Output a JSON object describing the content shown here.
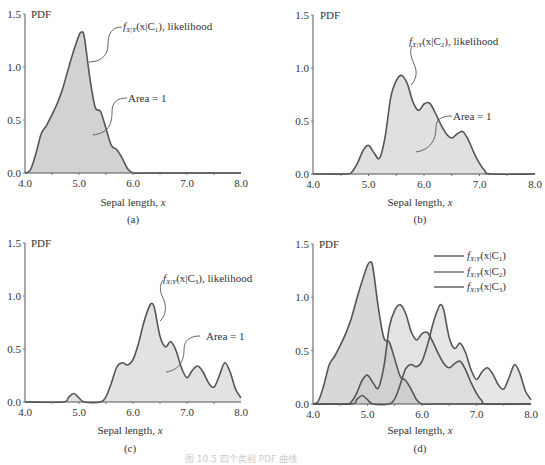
{
  "figure_caption": "图 10.5  四个类别 PDF 曲线",
  "colors": {
    "c1_fill": "#cfcfcf",
    "c2_fill": "#dedede",
    "c3_fill": "#e6e6e6",
    "c1_overlap_fill": "#bcbcbc",
    "c3_overlap_fill": "#a9a9a9",
    "line": "#555555"
  },
  "chart_data": [
    {
      "id": "a",
      "type": "area",
      "panel_label": "(a)",
      "xlabel": "Sepal length, x",
      "ylabel": "PDF",
      "xlim": [
        4.0,
        8.0
      ],
      "ylim": [
        0.0,
        1.5
      ],
      "xticks": [
        "4.0",
        "5.0",
        "6.0",
        "7.0",
        "8.0"
      ],
      "yticks": [
        "0.0",
        "0.5",
        "1.0",
        "1.5"
      ],
      "annotations": [
        "f_X|Y(x|C1), likelihood",
        "Area = 1"
      ],
      "series": [
        {
          "name": "f_X|Y(x|C1)",
          "x": [
            4.0,
            4.1,
            4.2,
            4.3,
            4.4,
            4.5,
            4.6,
            4.7,
            4.8,
            4.9,
            5.0,
            5.05,
            5.1,
            5.2,
            5.3,
            5.4,
            5.5,
            5.6,
            5.7,
            5.8,
            5.9,
            6.0,
            6.2,
            7.0,
            8.0
          ],
          "y": [
            0.0,
            0.03,
            0.18,
            0.37,
            0.45,
            0.55,
            0.66,
            0.8,
            0.98,
            1.15,
            1.3,
            1.33,
            1.28,
            0.9,
            0.62,
            0.58,
            0.42,
            0.26,
            0.22,
            0.14,
            0.04,
            0.0,
            0.0,
            0.0,
            0.0
          ]
        }
      ]
    },
    {
      "id": "b",
      "type": "area",
      "panel_label": "(b)",
      "xlabel": "Sepal length, x",
      "ylabel": "PDF",
      "xlim": [
        4.0,
        8.0
      ],
      "ylim": [
        0.0,
        1.5
      ],
      "xticks": [
        "4.0",
        "5.0",
        "6.0",
        "7.0",
        "8.0"
      ],
      "yticks": [
        "0.0",
        "0.5",
        "1.0",
        "1.5"
      ],
      "annotations": [
        "f_X|Y(x|C2), likelihood",
        "Area = 1"
      ],
      "series": [
        {
          "name": "f_X|Y(x|C2)",
          "x": [
            4.0,
            4.6,
            4.7,
            4.8,
            4.9,
            5.0,
            5.1,
            5.2,
            5.3,
            5.4,
            5.5,
            5.6,
            5.7,
            5.8,
            5.9,
            6.0,
            6.1,
            6.2,
            6.3,
            6.4,
            6.5,
            6.6,
            6.7,
            6.8,
            6.9,
            7.0,
            7.1,
            7.2,
            8.0
          ],
          "y": [
            0.0,
            0.0,
            0.02,
            0.1,
            0.22,
            0.27,
            0.2,
            0.15,
            0.35,
            0.72,
            0.88,
            0.93,
            0.85,
            0.68,
            0.6,
            0.66,
            0.67,
            0.58,
            0.47,
            0.38,
            0.34,
            0.38,
            0.4,
            0.32,
            0.2,
            0.1,
            0.03,
            0.0,
            0.0
          ]
        }
      ]
    },
    {
      "id": "c",
      "type": "area",
      "panel_label": "(c)",
      "xlabel": "Sepal length, x",
      "ylabel": "PDF",
      "xlim": [
        4.0,
        8.0
      ],
      "ylim": [
        0.0,
        1.5
      ],
      "xticks": [
        "4.0",
        "5.0",
        "6.0",
        "7.0",
        "8.0"
      ],
      "yticks": [
        "0.0",
        "0.5",
        "1.0",
        "1.5"
      ],
      "annotations": [
        "f_X|Y(x|C3), likelihood",
        "Area = 1"
      ],
      "series": [
        {
          "name": "f_X|Y(x|C3)",
          "x": [
            4.0,
            4.7,
            4.8,
            4.9,
            5.0,
            5.1,
            5.4,
            5.5,
            5.6,
            5.7,
            5.8,
            5.9,
            6.0,
            6.1,
            6.2,
            6.3,
            6.35,
            6.4,
            6.5,
            6.6,
            6.7,
            6.8,
            6.9,
            7.0,
            7.1,
            7.2,
            7.3,
            7.4,
            7.5,
            7.6,
            7.7,
            7.8,
            7.9,
            8.0
          ],
          "y": [
            0.0,
            0.0,
            0.04,
            0.08,
            0.04,
            0.0,
            0.0,
            0.05,
            0.18,
            0.33,
            0.37,
            0.35,
            0.4,
            0.55,
            0.75,
            0.9,
            0.93,
            0.88,
            0.62,
            0.52,
            0.57,
            0.48,
            0.32,
            0.23,
            0.3,
            0.34,
            0.28,
            0.18,
            0.14,
            0.25,
            0.37,
            0.28,
            0.12,
            0.04
          ]
        }
      ]
    },
    {
      "id": "d",
      "type": "area",
      "panel_label": "(d)",
      "xlabel": "Sepal length, x",
      "ylabel": "PDF",
      "xlim": [
        4.0,
        8.0
      ],
      "ylim": [
        0.0,
        1.5
      ],
      "xticks": [
        "4.0",
        "5.0",
        "6.0",
        "7.0",
        "8.0"
      ],
      "yticks": [
        "0.0",
        "0.5",
        "1.0",
        "1.5"
      ],
      "legend": [
        "f_X|Y(x|C1)",
        "f_X|Y(x|C2)",
        "f_X|Y(x|C3)"
      ],
      "legend_position": "upper right",
      "series_refs": [
        "a",
        "b",
        "c"
      ]
    }
  ],
  "panels": {
    "a": {
      "label": "(a)",
      "xlabel": "Sepal length, ",
      "xvar": "x",
      "ylabel": "PDF",
      "ann1_pre": "f",
      "ann1_sub": "X|Y",
      "ann1_mid": "(x|C",
      "ann1_idx": "1",
      "ann1_post": "), likelihood",
      "ann2": "Area = 1"
    },
    "b": {
      "label": "(b)",
      "xlabel": "Sepal length, ",
      "xvar": "x",
      "ylabel": "PDF",
      "ann1_pre": "f",
      "ann1_sub": "X|Y",
      "ann1_mid": "(x|C",
      "ann1_idx": "2",
      "ann1_post": "), likelihood",
      "ann2": "Area = 1"
    },
    "c": {
      "label": "(c)",
      "xlabel": "Sepal length, ",
      "xvar": "x",
      "ylabel": "PDF",
      "ann1_pre": "f",
      "ann1_sub": "X|Y",
      "ann1_mid": "(x|C",
      "ann1_idx": "3",
      "ann1_post": "), likelihood",
      "ann2": "Area = 1"
    },
    "d": {
      "label": "(d)",
      "xlabel": "Sepal length, ",
      "xvar": "x",
      "ylabel": "PDF",
      "legend": [
        {
          "pre": "f",
          "sub": "X|Y",
          "mid": "(x|C",
          "idx": "1",
          "post": ")"
        },
        {
          "pre": "f",
          "sub": "X|Y",
          "mid": "(x|C",
          "idx": "2",
          "post": ")"
        },
        {
          "pre": "f",
          "sub": "X|Y",
          "mid": "(x|C",
          "idx": "3",
          "post": ")"
        }
      ]
    }
  },
  "ticks": {
    "x": [
      "4.0",
      "5.0",
      "6.0",
      "7.0",
      "8.0"
    ],
    "y": [
      "0.0",
      "0.5",
      "1.0",
      "1.5"
    ]
  }
}
